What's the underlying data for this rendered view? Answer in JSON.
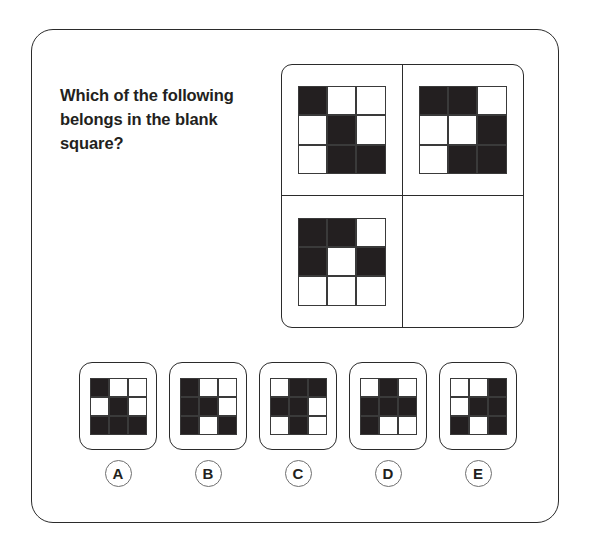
{
  "question": {
    "prompt": "Which of the following belongs in the blank square?"
  },
  "colors": {
    "fill": "#231f20",
    "empty": "#ffffff",
    "border": "#2b2b2b",
    "label_ring": "#6e6e6e"
  },
  "matrix": {
    "rows": 2,
    "cols": 2,
    "cells": [
      {
        "position": "top-left",
        "blank": false,
        "grid": [
          [
            1,
            0,
            0
          ],
          [
            0,
            1,
            0
          ],
          [
            0,
            1,
            1
          ]
        ]
      },
      {
        "position": "top-right",
        "blank": false,
        "grid": [
          [
            1,
            1,
            0
          ],
          [
            0,
            0,
            1
          ],
          [
            0,
            1,
            1
          ]
        ]
      },
      {
        "position": "bottom-left",
        "blank": false,
        "grid": [
          [
            1,
            1,
            0
          ],
          [
            1,
            0,
            1
          ],
          [
            0,
            0,
            0
          ]
        ]
      },
      {
        "position": "bottom-right",
        "blank": true,
        "grid": [
          [
            0,
            0,
            0
          ],
          [
            0,
            0,
            0
          ],
          [
            0,
            0,
            0
          ]
        ]
      }
    ]
  },
  "options": [
    {
      "label": "A",
      "grid": [
        [
          1,
          0,
          0
        ],
        [
          0,
          1,
          0
        ],
        [
          1,
          1,
          1
        ]
      ]
    },
    {
      "label": "B",
      "grid": [
        [
          1,
          0,
          0
        ],
        [
          1,
          1,
          0
        ],
        [
          1,
          0,
          1
        ]
      ]
    },
    {
      "label": "C",
      "grid": [
        [
          0,
          1,
          1
        ],
        [
          1,
          1,
          0
        ],
        [
          0,
          1,
          0
        ]
      ]
    },
    {
      "label": "D",
      "grid": [
        [
          0,
          1,
          0
        ],
        [
          1,
          1,
          1
        ],
        [
          1,
          0,
          0
        ]
      ]
    },
    {
      "label": "E",
      "grid": [
        [
          0,
          0,
          1
        ],
        [
          0,
          1,
          1
        ],
        [
          1,
          0,
          1
        ]
      ]
    }
  ]
}
